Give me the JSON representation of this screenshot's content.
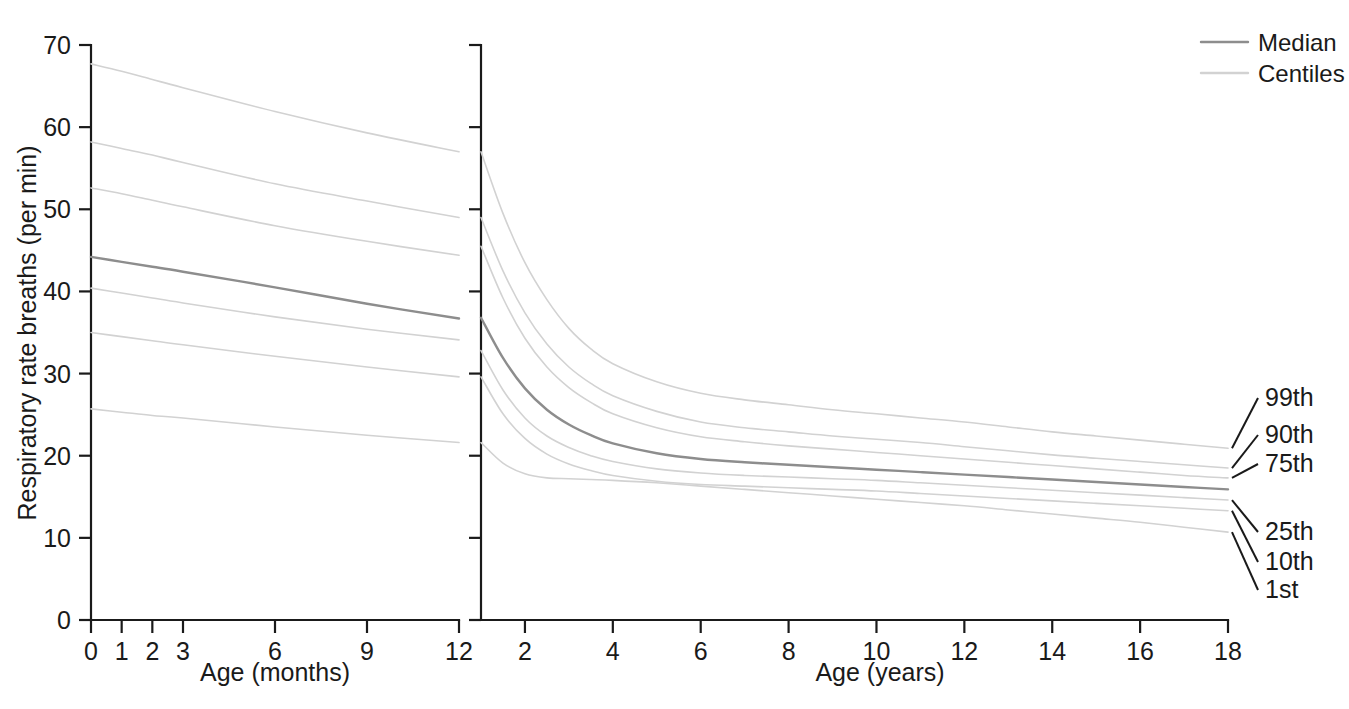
{
  "chart_data": {
    "type": "line",
    "title": "",
    "ylabel": "Respiratory rate breaths (per min)",
    "ylim": [
      0,
      70
    ],
    "yticks": [
      0,
      10,
      20,
      30,
      40,
      50,
      60,
      70
    ],
    "grid": false,
    "legend_position": "top-right",
    "panels": [
      {
        "name": "infants-panel",
        "xlabel": "Age (months)",
        "xlim": [
          0,
          12
        ],
        "xticks": [
          0,
          1,
          2,
          3,
          6,
          9,
          12
        ],
        "x": [
          0,
          1,
          2,
          3,
          6,
          9,
          12
        ],
        "series": [
          {
            "name": "99th",
            "style": "centile",
            "values": [
              67.7,
              66.8,
              65.8,
              64.8,
              61.9,
              59.3,
              57.0
            ]
          },
          {
            "name": "90th",
            "style": "centile",
            "values": [
              58.2,
              57.4,
              56.6,
              55.7,
              53.1,
              51.0,
              49.0
            ]
          },
          {
            "name": "75th",
            "style": "centile",
            "values": [
              52.6,
              51.9,
              51.1,
              50.3,
              48.0,
              46.1,
              44.4
            ]
          },
          {
            "name": "Median",
            "style": "median",
            "values": [
              44.2,
              43.6,
              43.0,
              42.4,
              40.5,
              38.5,
              36.7
            ]
          },
          {
            "name": "25th",
            "style": "centile",
            "values": [
              40.4,
              39.8,
              39.2,
              38.6,
              36.9,
              35.4,
              34.1
            ]
          },
          {
            "name": "10th",
            "style": "centile",
            "values": [
              35.0,
              34.5,
              34.0,
              33.5,
              32.1,
              30.8,
              29.6
            ]
          },
          {
            "name": "1st",
            "style": "centile",
            "values": [
              25.7,
              25.3,
              24.9,
              24.6,
              23.5,
              22.5,
              21.6
            ]
          }
        ]
      },
      {
        "name": "children-panel",
        "xlabel": "Age (years)",
        "xlim": [
          1,
          18
        ],
        "xticks": [
          2,
          4,
          6,
          8,
          10,
          12,
          14,
          16,
          18
        ],
        "x": [
          1,
          1.5,
          2,
          2.5,
          3,
          3.5,
          4,
          5,
          6,
          7,
          8,
          9,
          10,
          11,
          12,
          13,
          14,
          15,
          16,
          17,
          18
        ],
        "series": [
          {
            "name": "99th",
            "style": "centile",
            "values": [
              57.0,
              49.5,
              43.5,
              39.0,
              35.5,
              33.0,
              31.2,
              29.0,
              27.6,
              26.8,
              26.2,
              25.6,
              25.1,
              24.6,
              24.1,
              23.5,
              22.9,
              22.4,
              21.9,
              21.4,
              20.9
            ]
          },
          {
            "name": "90th",
            "style": "centile",
            "values": [
              49.0,
              42.5,
              37.4,
              33.6,
              30.8,
              28.8,
              27.3,
              25.4,
              24.1,
              23.4,
              22.9,
              22.4,
              22.0,
              21.6,
              21.1,
              20.6,
              20.1,
              19.7,
              19.3,
              18.9,
              18.5
            ]
          },
          {
            "name": "75th",
            "style": "centile",
            "values": [
              45.5,
              39.2,
              34.3,
              30.8,
              28.3,
              26.5,
              25.1,
              23.4,
              22.3,
              21.7,
              21.2,
              20.8,
              20.4,
              20.0,
              19.6,
              19.2,
              18.8,
              18.4,
              18.0,
              17.6,
              17.3
            ]
          },
          {
            "name": "Median",
            "style": "median",
            "values": [
              36.8,
              31.9,
              28.2,
              25.6,
              23.8,
              22.5,
              21.5,
              20.3,
              19.6,
              19.2,
              18.9,
              18.6,
              18.3,
              18.0,
              17.7,
              17.4,
              17.1,
              16.8,
              16.5,
              16.2,
              15.9
            ]
          },
          {
            "name": "25th",
            "style": "centile",
            "values": [
              32.8,
              28.0,
              24.6,
              22.4,
              21.0,
              20.0,
              19.3,
              18.4,
              17.9,
              17.6,
              17.4,
              17.2,
              17.0,
              16.7,
              16.4,
              16.1,
              15.8,
              15.5,
              15.2,
              14.9,
              14.6
            ]
          },
          {
            "name": "10th",
            "style": "centile",
            "values": [
              29.6,
              25.1,
              22.1,
              20.2,
              19.0,
              18.2,
              17.6,
              16.9,
              16.5,
              16.3,
              16.1,
              15.9,
              15.7,
              15.4,
              15.1,
              14.8,
              14.5,
              14.2,
              13.9,
              13.6,
              13.3
            ]
          },
          {
            "name": "1st",
            "style": "centile",
            "values": [
              21.6,
              19.1,
              17.8,
              17.3,
              17.2,
              17.1,
              17.0,
              16.7,
              16.3,
              15.9,
              15.5,
              15.1,
              14.7,
              14.3,
              13.9,
              13.4,
              12.9,
              12.4,
              11.9,
              11.3,
              10.7
            ]
          }
        ]
      }
    ],
    "legend": [
      {
        "label": "Median",
        "color": "#8d8d8d"
      },
      {
        "label": "Centiles",
        "color": "#d2d2d2"
      }
    ],
    "annotations": [
      {
        "label": "99th"
      },
      {
        "label": "90th"
      },
      {
        "label": "75th"
      },
      {
        "label": "25th"
      },
      {
        "label": "10th"
      },
      {
        "label": "1st"
      }
    ]
  },
  "colors": {
    "median": "#8d8d8d",
    "centile": "#d2d2d2",
    "axis": "#1a1a1a",
    "background": "#ffffff"
  }
}
